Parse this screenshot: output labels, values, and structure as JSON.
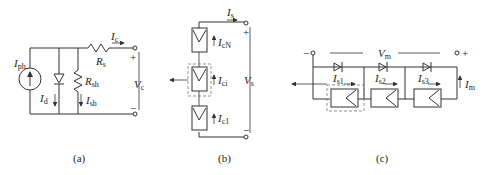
{
  "panels": {
    "a": {
      "caption": "(a)",
      "labels": {
        "Iph": {
          "main": "I",
          "sub": "ph"
        },
        "Id": {
          "main": "I",
          "sub": "d"
        },
        "Rsh": {
          "main": "R",
          "sub": "sh"
        },
        "Ish": {
          "main": "I",
          "sub": "sh"
        },
        "Rs": {
          "main": "R",
          "sub": "s"
        },
        "Ic": {
          "main": "I",
          "sub": "c"
        },
        "Vc": {
          "main": "V",
          "sub": "c"
        },
        "plus": "+",
        "minus": "−"
      }
    },
    "b": {
      "caption": "(b)",
      "labels": {
        "Is": {
          "main": "I",
          "sub": "s"
        },
        "IcN": {
          "main": "I",
          "sub": "cN"
        },
        "Ici": {
          "main": "I",
          "sub": "ci"
        },
        "Ic1": {
          "main": "I",
          "sub": "c1"
        },
        "Vs": {
          "main": "V",
          "sub": "s"
        },
        "plus": "+",
        "minus": "−"
      }
    },
    "c": {
      "caption": "(c)",
      "labels": {
        "Vm": {
          "main": "V",
          "sub": "m"
        },
        "Is1": {
          "main": "I",
          "sub": "s1"
        },
        "Is2": {
          "main": "I",
          "sub": "s2"
        },
        "Is3": {
          "main": "I",
          "sub": "s3"
        },
        "Im": {
          "main": "I",
          "sub": "m"
        },
        "plus": "+",
        "minus": "−"
      }
    }
  }
}
